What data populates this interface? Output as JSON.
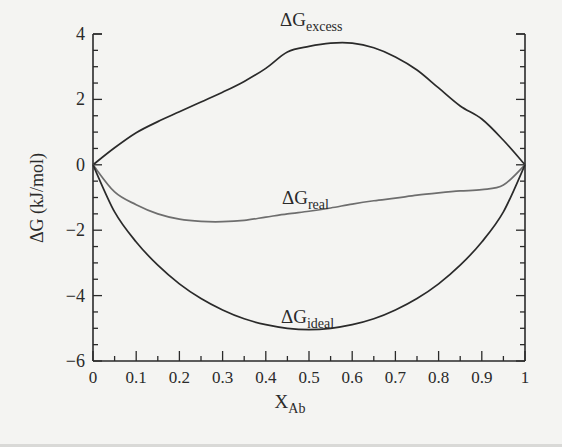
{
  "chart_data": {
    "type": "line",
    "title": "",
    "xlabel": "X",
    "xlabel_sub": "Ab",
    "ylabel": "ΔG (kJ/mol)",
    "xlim": [
      0,
      1
    ],
    "ylim": [
      -6,
      4
    ],
    "x_ticks": [
      0,
      0.1,
      0.2,
      0.3,
      0.4,
      0.5,
      0.6,
      0.7,
      0.8,
      0.9,
      1
    ],
    "x_tick_labels": [
      "0",
      "0.1",
      "0.2",
      "0.3",
      "0.4",
      "0.5",
      "0.6",
      "0.7",
      "0.8",
      "0.9",
      "1"
    ],
    "x_minor_step": 0.05,
    "y_ticks": [
      -6,
      -4,
      -2,
      0,
      2,
      4
    ],
    "y_tick_labels": [
      "−6",
      "−4",
      "−2",
      "0",
      "2",
      "4"
    ],
    "y_minor_step": 0.5,
    "grid": false,
    "legend": "inline labels",
    "x": [
      0,
      0.05,
      0.1,
      0.15,
      0.2,
      0.25,
      0.3,
      0.35,
      0.4,
      0.45,
      0.5,
      0.55,
      0.6,
      0.65,
      0.7,
      0.75,
      0.8,
      0.85,
      0.9,
      0.95,
      1
    ],
    "series": [
      {
        "name": "ΔG_excess",
        "label_main": "ΔG",
        "label_sub": "excess",
        "color": "#2a2a2a",
        "values": [
          0,
          0.52,
          0.98,
          1.32,
          1.62,
          1.92,
          2.22,
          2.55,
          2.95,
          3.45,
          3.62,
          3.72,
          3.72,
          3.58,
          3.3,
          2.9,
          2.35,
          1.8,
          1.4,
          0.75,
          0
        ]
      },
      {
        "name": "ΔG_real",
        "label_main": "ΔG",
        "label_sub": "real",
        "color": "#6e6e6e",
        "values": [
          0,
          -0.83,
          -1.22,
          -1.5,
          -1.66,
          -1.73,
          -1.74,
          -1.7,
          -1.6,
          -1.5,
          -1.42,
          -1.32,
          -1.2,
          -1.1,
          -1.02,
          -0.93,
          -0.86,
          -0.8,
          -0.76,
          -0.62,
          0
        ]
      },
      {
        "name": "ΔG_ideal",
        "label_main": "ΔG",
        "label_sub": "ideal",
        "color": "#2a2a2a",
        "values": [
          0,
          -1.44,
          -2.36,
          -3.07,
          -3.64,
          -4.09,
          -4.44,
          -4.71,
          -4.89,
          -5.0,
          -5.04,
          -5.0,
          -4.89,
          -4.71,
          -4.44,
          -4.09,
          -3.64,
          -3.07,
          -2.36,
          -1.44,
          0
        ]
      }
    ]
  },
  "labels": {
    "excess": {
      "main": "ΔG",
      "sub": "excess"
    },
    "real": {
      "main": "ΔG",
      "sub": "real"
    },
    "ideal": {
      "main": "ΔG",
      "sub": "ideal"
    },
    "xaxis": {
      "main": "X",
      "sub": "Ab"
    },
    "yaxis": "ΔG (kJ/mol)"
  }
}
